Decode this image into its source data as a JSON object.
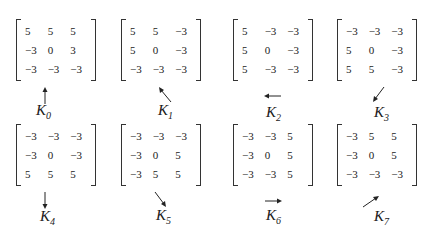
{
  "kernels": [
    {
      "name": "K",
      "sub": "0",
      "direction": "up",
      "rows": [
        [
          "5",
          "5",
          "5"
        ],
        [
          "−3",
          "0",
          "3"
        ],
        [
          "−3",
          "−3",
          "−3"
        ]
      ]
    },
    {
      "name": "K",
      "sub": "1",
      "direction": "up-left",
      "rows": [
        [
          "5",
          "5",
          "−3"
        ],
        [
          "5",
          "0",
          "−3"
        ],
        [
          "−3",
          "−3",
          "−3"
        ]
      ]
    },
    {
      "name": "K",
      "sub": "2",
      "direction": "left",
      "rows": [
        [
          "5",
          "−3",
          "−3"
        ],
        [
          "5",
          "0",
          "−3"
        ],
        [
          "5",
          "−3",
          "−3"
        ]
      ]
    },
    {
      "name": "K",
      "sub": "3",
      "direction": "down-left",
      "rows": [
        [
          "−3",
          "−3",
          "−3"
        ],
        [
          "5",
          "0",
          "−3"
        ],
        [
          "5",
          "5",
          "−3"
        ]
      ]
    },
    {
      "name": "K",
      "sub": "4",
      "direction": "down",
      "rows": [
        [
          "−3",
          "−3",
          "−3"
        ],
        [
          "−3",
          "0",
          "−3"
        ],
        [
          "5",
          "5",
          "5"
        ]
      ]
    },
    {
      "name": "K",
      "sub": "5",
      "direction": "down-right",
      "rows": [
        [
          "−3",
          "−3",
          "−3"
        ],
        [
          "−3",
          "0",
          "5"
        ],
        [
          "−3",
          "5",
          "5"
        ]
      ]
    },
    {
      "name": "K",
      "sub": "6",
      "direction": "right",
      "rows": [
        [
          "−3",
          "−3",
          "5"
        ],
        [
          "−3",
          "0",
          "5"
        ],
        [
          "−3",
          "−3",
          "5"
        ]
      ]
    },
    {
      "name": "K",
      "sub": "7",
      "direction": "up-right",
      "rows": [
        [
          "−3",
          "5",
          "5"
        ],
        [
          "−3",
          "0",
          "5"
        ],
        [
          "−3",
          "−3",
          "−3"
        ]
      ]
    }
  ]
}
